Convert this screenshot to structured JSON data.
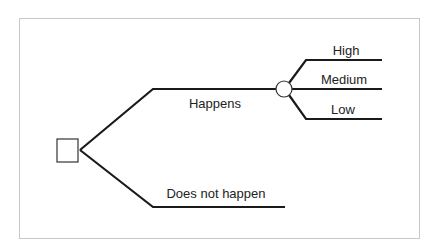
{
  "diagram": {
    "type": "decision-tree",
    "root": {
      "kind": "decision",
      "shape": "square"
    },
    "branches": [
      {
        "label": "Happens",
        "outcome_node": {
          "kind": "chance",
          "shape": "circle",
          "branches": [
            {
              "label": "High"
            },
            {
              "label": "Medium"
            },
            {
              "label": "Low"
            }
          ]
        }
      },
      {
        "label": "Does not happen"
      }
    ],
    "colors": {
      "line": "#1a1a1a",
      "frame": "#c8c8c8",
      "text": "#222222",
      "background": "#ffffff"
    }
  }
}
